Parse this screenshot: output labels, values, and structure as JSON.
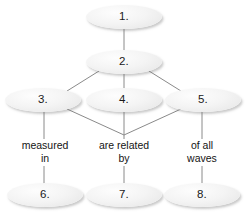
{
  "diagram": {
    "type": "concept-map",
    "background_color": "#ffffff",
    "node_fill_color": "#f2f2f2",
    "connector_color": "#808080",
    "text_color": "#141414",
    "nodes": [
      {
        "id": "node-1",
        "label": "1.",
        "cx": 124,
        "cy": 17,
        "rx": 38,
        "ry": 12
      },
      {
        "id": "node-2",
        "label": "2.",
        "cx": 124,
        "cy": 62,
        "rx": 38,
        "ry": 12
      },
      {
        "id": "node-3",
        "label": "3.",
        "cx": 43,
        "cy": 100,
        "rx": 38,
        "ry": 12
      },
      {
        "id": "node-4",
        "label": "4.",
        "cx": 124,
        "cy": 100,
        "rx": 38,
        "ry": 12
      },
      {
        "id": "node-5",
        "label": "5.",
        "cx": 203,
        "cy": 100,
        "rx": 38,
        "ry": 12
      },
      {
        "id": "node-6",
        "label": "6.",
        "cx": 45,
        "cy": 195,
        "rx": 38,
        "ry": 12
      },
      {
        "id": "node-7",
        "label": "7.",
        "cx": 124,
        "cy": 195,
        "rx": 38,
        "ry": 12
      },
      {
        "id": "node-8",
        "label": "8.",
        "cx": 202,
        "cy": 195,
        "rx": 38,
        "ry": 12
      }
    ],
    "edge_labels": [
      {
        "id": "edge-label-measured-in",
        "text": "measured\nin",
        "cx": 45,
        "cy": 152
      },
      {
        "id": "edge-label-are-related-by",
        "text": "are related\nby",
        "cx": 124,
        "cy": 152
      },
      {
        "id": "edge-label-of-all-waves",
        "text": "of all\nwaves",
        "cx": 202,
        "cy": 152
      }
    ],
    "connectors": [
      {
        "id": "connector-1-to-2",
        "from": "node-1",
        "to": "node-2"
      },
      {
        "id": "connector-2-to-3",
        "from": "node-2",
        "to": "node-3"
      },
      {
        "id": "connector-2-to-4",
        "from": "node-2",
        "to": "node-4"
      },
      {
        "id": "connector-2-to-5",
        "from": "node-2",
        "to": "node-5"
      },
      {
        "id": "connector-3-to-6",
        "from": "node-3",
        "to": "node-6"
      },
      {
        "id": "connector-4-to-7",
        "from": "node-4",
        "to": "node-7"
      },
      {
        "id": "connector-5-to-8",
        "from": "node-5",
        "to": "node-8"
      },
      {
        "id": "connector-3-to-junction",
        "from": "node-3",
        "to": "junction"
      },
      {
        "id": "connector-5-to-junction",
        "from": "node-5",
        "to": "junction"
      }
    ]
  }
}
